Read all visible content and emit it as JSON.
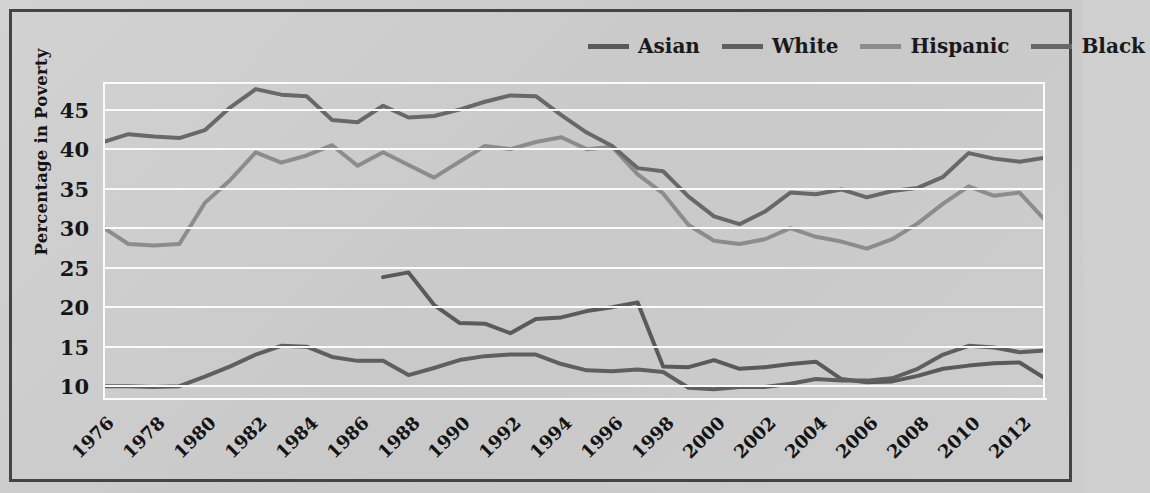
{
  "figure": {
    "background_color": "#cdcdcd",
    "border_color": "#444444",
    "gridline_color": "#fbfbfb"
  },
  "legend": {
    "position": "top-right",
    "entries": [
      {
        "label": "Asian",
        "color": "#5a5a5a"
      },
      {
        "label": "White",
        "color": "#5f5f5f"
      },
      {
        "label": "Hispanic",
        "color": "#8c8c8c"
      },
      {
        "label": "Black",
        "color": "#686868"
      }
    ]
  },
  "chart_data": {
    "type": "line",
    "title": "",
    "xlabel": "",
    "ylabel": "Percentage in Poverty",
    "xlim": [
      1976,
      2013
    ],
    "ylim": [
      8.5,
      48.5
    ],
    "yticks": [
      10,
      15,
      20,
      25,
      30,
      35,
      40,
      45
    ],
    "xticks": [
      1976,
      1978,
      1980,
      1982,
      1984,
      1986,
      1988,
      1990,
      1992,
      1994,
      1996,
      1998,
      2000,
      2002,
      2004,
      2006,
      2008,
      2010,
      2012
    ],
    "grid": true,
    "legend_position": "top-right",
    "series": [
      {
        "name": "Asian",
        "color": "#5a5a5a",
        "x": [
          1987,
          1988,
          1989,
          1990,
          1991,
          1992,
          1993,
          1994,
          1995,
          1996,
          1997,
          1998,
          1999,
          2000,
          2001,
          2002,
          2003,
          2004,
          2005,
          2006,
          2007,
          2008,
          2009,
          2010,
          2011,
          2012,
          2013
        ],
        "values": [
          23.8,
          24.4,
          20.3,
          18.0,
          17.9,
          16.7,
          18.5,
          18.7,
          19.5,
          20.0,
          20.6,
          12.5,
          12.4,
          13.3,
          12.2,
          12.4,
          12.8,
          13.1,
          10.9,
          10.5,
          10.6,
          11.3,
          12.2,
          12.6,
          12.9,
          13.0,
          11.0
        ]
      },
      {
        "name": "White",
        "color": "#5f5f5f",
        "x": [
          1976,
          1977,
          1978,
          1979,
          1980,
          1981,
          1982,
          1983,
          1984,
          1985,
          1986,
          1987,
          1988,
          1989,
          1990,
          1991,
          1992,
          1993,
          1994,
          1995,
          1996,
          1997,
          1998,
          1999,
          2000,
          2001,
          2002,
          2003,
          2004,
          2005,
          2006,
          2007,
          2008,
          2009,
          2010,
          2011,
          2012,
          2013
        ],
        "values": [
          10.0,
          10.0,
          9.9,
          10.0,
          11.2,
          12.5,
          14.0,
          15.1,
          15.0,
          13.7,
          13.2,
          13.2,
          11.4,
          12.3,
          13.3,
          13.8,
          14.0,
          14.0,
          12.8,
          12.0,
          11.9,
          12.1,
          11.8,
          9.8,
          9.6,
          9.9,
          9.9,
          10.3,
          10.9,
          10.7,
          10.7,
          11.0,
          12.2,
          14.0,
          15.1,
          14.9,
          14.3,
          14.5
        ]
      },
      {
        "name": "Hispanic",
        "color": "#8c8c8c",
        "x": [
          1976,
          1977,
          1978,
          1979,
          1980,
          1981,
          1982,
          1983,
          1984,
          1985,
          1986,
          1987,
          1988,
          1989,
          1990,
          1991,
          1992,
          1993,
          1994,
          1995,
          1996,
          1997,
          1998,
          1999,
          2000,
          2001,
          2002,
          2003,
          2004,
          2005,
          2006,
          2007,
          2008,
          2009,
          2010,
          2011,
          2012,
          2013
        ],
        "values": [
          30.1,
          28.0,
          27.8,
          28.0,
          33.2,
          36.1,
          39.6,
          38.3,
          39.2,
          40.5,
          37.9,
          39.6,
          38.0,
          36.4,
          38.4,
          40.4,
          40.0,
          40.9,
          41.5,
          40.0,
          40.3,
          36.8,
          34.4,
          30.4,
          28.4,
          28.0,
          28.6,
          30.0,
          28.9,
          28.3,
          27.4,
          28.6,
          30.6,
          33.1,
          35.3,
          34.1,
          34.5,
          31.0
        ]
      },
      {
        "name": "Black",
        "color": "#686868",
        "x": [
          1976,
          1977,
          1978,
          1979,
          1980,
          1981,
          1982,
          1983,
          1984,
          1985,
          1986,
          1987,
          1988,
          1989,
          1990,
          1991,
          1992,
          1993,
          1994,
          1995,
          1996,
          1997,
          1998,
          1999,
          2000,
          2001,
          2002,
          2003,
          2004,
          2005,
          2006,
          2007,
          2008,
          2009,
          2010,
          2011,
          2012,
          2013
        ],
        "values": [
          40.9,
          41.9,
          41.6,
          41.4,
          42.4,
          45.3,
          47.6,
          46.9,
          46.7,
          43.7,
          43.4,
          45.5,
          44.0,
          44.2,
          45.0,
          46.0,
          46.8,
          46.7,
          44.3,
          42.1,
          40.4,
          37.6,
          37.2,
          34.0,
          31.5,
          30.5,
          32.1,
          34.5,
          34.3,
          34.9,
          33.9,
          34.7,
          35.1,
          36.5,
          39.5,
          38.8,
          38.4,
          38.9
        ]
      }
    ]
  }
}
